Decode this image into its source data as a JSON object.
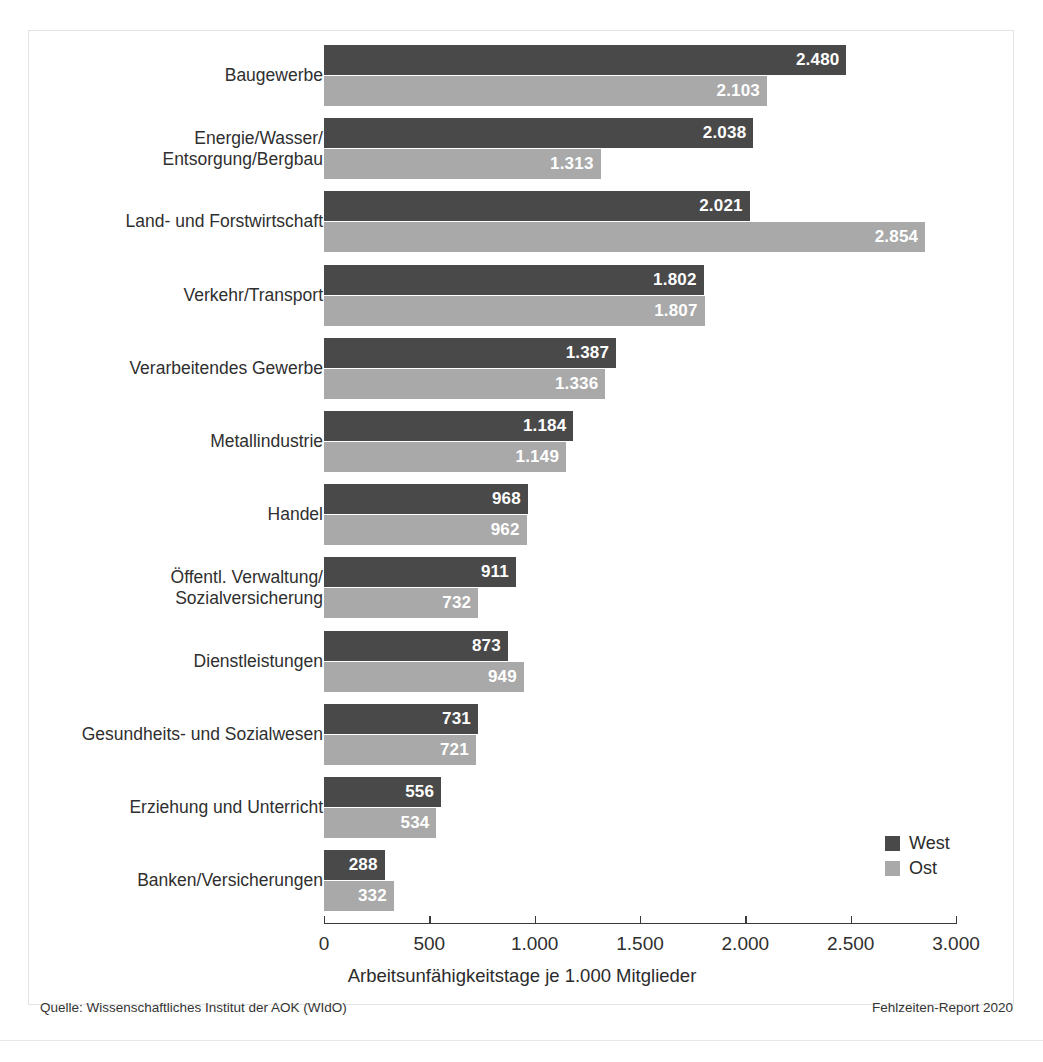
{
  "chart_data": {
    "type": "bar",
    "orientation": "horizontal",
    "title": "",
    "xlabel": "Arbeitsunfähigkeitstage je 1.000 Mitglieder",
    "ylabel": "",
    "xlim": [
      0,
      3000
    ],
    "xticks": [
      0,
      500,
      1000,
      1500,
      2000,
      2500,
      3000
    ],
    "xtick_labels": [
      "0",
      "500",
      "1.000",
      "1.500",
      "2.000",
      "2.500",
      "3.000"
    ],
    "grid": false,
    "legend_position": "bottom-right",
    "categories": [
      "Baugewerbe",
      "Energie/Wasser/\nEntsorgung/Bergbau",
      "Land- und Forstwirtschaft",
      "Verkehr/Transport",
      "Verarbeitendes Gewerbe",
      "Metallindustrie",
      "Handel",
      "Öffentl. Verwaltung/\nSozialversicherung",
      "Dienstleistungen",
      "Gesundheits- und Sozialwesen",
      "Erziehung und Unterricht",
      "Banken/Versicherungen"
    ],
    "series": [
      {
        "name": "West",
        "color": "#494949",
        "values": [
          2480,
          2038,
          2021,
          1802,
          1387,
          1184,
          968,
          911,
          873,
          731,
          556,
          288
        ],
        "labels": [
          "2.480",
          "2.038",
          "2.021",
          "1.802",
          "1.387",
          "1.184",
          "968",
          "911",
          "873",
          "731",
          "556",
          "288"
        ]
      },
      {
        "name": "Ost",
        "color": "#a9a9a9",
        "values": [
          2103,
          1313,
          2854,
          1807,
          1336,
          1149,
          962,
          732,
          949,
          721,
          534,
          332
        ],
        "labels": [
          "2.103",
          "1.313",
          "2.854",
          "1.807",
          "1.336",
          "1.149",
          "962",
          "732",
          "949",
          "721",
          "534",
          "332"
        ]
      }
    ]
  },
  "legend": {
    "items": [
      {
        "label": "West",
        "color": "#494949"
      },
      {
        "label": "Ost",
        "color": "#a9a9a9"
      }
    ]
  },
  "footer": {
    "source": "Quelle: Wissenschaftliches Institut der AOK (WIdO)",
    "report": "Fehlzeiten-Report 2020"
  }
}
